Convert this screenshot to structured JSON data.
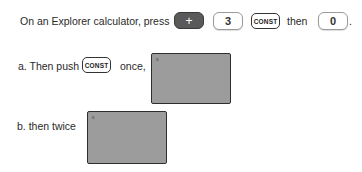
{
  "instruction": {
    "prefix": "On an Explorer calculator, press",
    "keys": [
      {
        "label": "+",
        "style": "dark"
      },
      {
        "label": "3",
        "style": "light"
      },
      {
        "label": "CONST",
        "style": "outlined"
      }
    ],
    "then_text": "then",
    "final_key": {
      "label": "0",
      "style": "light"
    },
    "end_punct": "."
  },
  "part_a": {
    "label": "a. Then push",
    "key": "CONST",
    "suffix": "once,",
    "screen_mark": "s"
  },
  "part_b": {
    "label": "b. then twice",
    "screen_mark": "s"
  },
  "colors": {
    "dark_key": "#5a5a5a",
    "screen_fill": "#9c9c9c",
    "screen_border": "#2e2e2e"
  }
}
